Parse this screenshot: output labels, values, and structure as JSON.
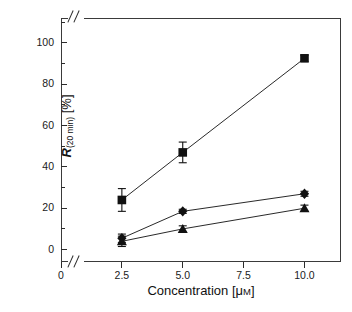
{
  "chart_data": {
    "type": "line",
    "title": "",
    "xlabel": "Concentration [μM]",
    "ylabel": "R(20 min) [%]",
    "ylabel_parts": {
      "symbol": "R",
      "subscript": "(20 min)",
      "unit": "[%]"
    },
    "x": [
      2.5,
      5.0,
      10.0
    ],
    "xlim": [
      0,
      11.5
    ],
    "ylim": [
      -6,
      112
    ],
    "grid": false,
    "legend": "none",
    "axis_break_x": true,
    "xticks": [
      0,
      2.5,
      5.0,
      7.5,
      10.0
    ],
    "xtick_labels": [
      "0",
      "2.5",
      "5.0",
      "7.5",
      "10.0"
    ],
    "yticks": [
      0,
      20,
      40,
      60,
      80,
      100
    ],
    "ytick_labels": [
      "0",
      "20",
      "40",
      "60",
      "80",
      "100"
    ],
    "yticks_minor": [
      10,
      30,
      50,
      70,
      90,
      110
    ],
    "series": [
      {
        "name": "square-series",
        "marker": "square",
        "color": "#111111",
        "values": [
          24.0,
          47.0,
          92.5
        ],
        "errors": [
          5.5,
          5.0,
          1.5
        ]
      },
      {
        "name": "diamond-series",
        "marker": "diamond",
        "color": "#111111",
        "values": [
          5.5,
          18.5,
          27.0
        ],
        "errors": [
          2.0,
          1.0,
          1.2
        ]
      },
      {
        "name": "triangle-series",
        "marker": "triangle",
        "color": "#111111",
        "values": [
          4.0,
          10.0,
          20.0
        ],
        "errors": [
          2.5,
          1.5,
          1.5
        ]
      }
    ]
  },
  "axis": {
    "x_title": "Concentration [μM]",
    "x_title_main": "Concentration [",
    "x_title_mu": "μ",
    "x_title_m": "M",
    "x_title_close": "]",
    "y_symbol": "R",
    "y_subscript": "(20 min)",
    "y_unit": " [%]"
  },
  "caption": {
    "cropped_line": "—  —  —   — —    —  —  — —   —  —  —  —   — —  —  —  — —"
  }
}
